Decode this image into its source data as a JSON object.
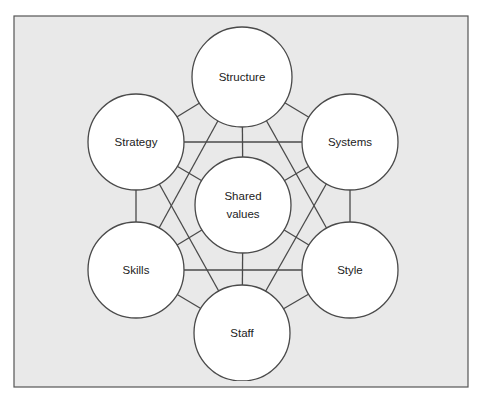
{
  "diagram": {
    "colors": {
      "background": "#e9e9e9",
      "frame_border": "#555555",
      "circle_fill": "#ffffff",
      "line": "#4a4a4a",
      "text": "#222222"
    },
    "nodes": [
      {
        "id": "structure",
        "label": "Structure",
        "cx": 242,
        "cy": 77,
        "r": 50
      },
      {
        "id": "strategy",
        "label": "Strategy",
        "cx": 136,
        "cy": 142,
        "r": 48
      },
      {
        "id": "systems",
        "label": "Systems",
        "cx": 350,
        "cy": 142,
        "r": 48
      },
      {
        "id": "shared_values",
        "label": "Shared values",
        "label_lines": [
          "Shared",
          "values"
        ],
        "cx": 243,
        "cy": 205,
        "r": 48
      },
      {
        "id": "skills",
        "label": "Skills",
        "cx": 136,
        "cy": 270,
        "r": 48
      },
      {
        "id": "style",
        "label": "Style",
        "cx": 350,
        "cy": 270,
        "r": 48
      },
      {
        "id": "staff",
        "label": "Staff",
        "cx": 242,
        "cy": 333,
        "r": 48
      }
    ],
    "edges": [
      [
        "structure",
        "strategy"
      ],
      [
        "structure",
        "systems"
      ],
      [
        "strategy",
        "skills"
      ],
      [
        "systems",
        "style"
      ],
      [
        "skills",
        "staff"
      ],
      [
        "style",
        "staff"
      ],
      [
        "strategy",
        "systems"
      ],
      [
        "skills",
        "style"
      ],
      [
        "structure",
        "shared_values"
      ],
      [
        "shared_values",
        "staff"
      ],
      [
        "structure",
        "skills"
      ],
      [
        "structure",
        "style"
      ],
      [
        "staff",
        "strategy"
      ],
      [
        "staff",
        "systems"
      ],
      [
        "shared_values",
        "strategy"
      ],
      [
        "shared_values",
        "systems"
      ],
      [
        "shared_values",
        "skills"
      ],
      [
        "shared_values",
        "style"
      ]
    ]
  }
}
